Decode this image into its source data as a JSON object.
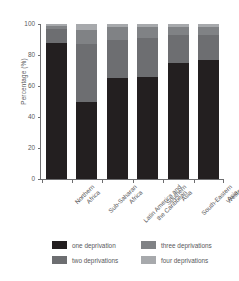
{
  "chart_data": {
    "type": "bar",
    "subtype": "stacked-100-percent",
    "title": "",
    "xlabel": "",
    "ylabel": "Percentage (%)",
    "ylim": [
      0,
      100
    ],
    "yticks": [
      0,
      20,
      40,
      60,
      80,
      100
    ],
    "ytick_labels": [
      "0",
      "20",
      "40",
      "60",
      "80",
      "100"
    ],
    "grid": false,
    "legend_position": "bottom",
    "categories": [
      "Northern Africa",
      "Sub-Saharan Africa",
      "Latin America and the Caribbean",
      "Southern Asia",
      "South-Eastern Asia",
      "Western Asia"
    ],
    "category_lines": [
      [
        "Northern",
        "Africa"
      ],
      [
        "Sub-Saharan",
        "Africa"
      ],
      [
        "Latin America and",
        "the Caribbean"
      ],
      [
        "Southern",
        "Asia"
      ],
      [
        "South-Eastern",
        "Asia"
      ],
      [
        "Western",
        "Asia"
      ]
    ],
    "series": [
      {
        "name": "one deprivation",
        "color": "#231f20",
        "values": [
          88,
          50,
          65,
          66,
          75,
          77
        ]
      },
      {
        "name": "two deprivations",
        "color": "#6d6e71",
        "values": [
          9,
          37,
          25,
          25,
          18,
          16
        ]
      },
      {
        "name": "three deprivations",
        "color": "#808285",
        "values": [
          2,
          9,
          8,
          7,
          5,
          5
        ]
      },
      {
        "name": "four deprivations",
        "color": "#a7a9ac",
        "values": [
          1,
          4,
          2,
          2,
          2,
          2
        ]
      }
    ]
  },
  "legend": {
    "items": [
      {
        "label": "one deprivation",
        "color": "#231f20"
      },
      {
        "label": "three deprivations",
        "color": "#808285"
      },
      {
        "label": "two deprivations",
        "color": "#6d6e71"
      },
      {
        "label": "four deprivations",
        "color": "#a7a9ac"
      }
    ]
  }
}
